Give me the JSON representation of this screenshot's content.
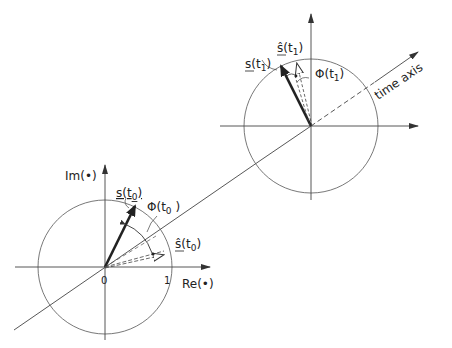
{
  "figure": {
    "type": "phasor-diagram",
    "colors": {
      "line": "#333333",
      "background": "#ffffff"
    },
    "time_axis_label": "time axis",
    "frame_t0": {
      "imag_axis_label": "Im(•)",
      "real_axis_label": "Re(•)",
      "origin_label": "0",
      "unit_label": "1",
      "phasor_label": "s(t",
      "phasor_sub": "0",
      "estimate_label": "ŝ(t",
      "estimate_sub": "0",
      "phase_label": "Φ(t",
      "phase_sub": "0"
    },
    "frame_t1": {
      "phasor_label": "s(t",
      "phasor_sub": "1",
      "estimate_label": "ŝ(t",
      "estimate_sub": "1",
      "phase_label": "Φ(t",
      "phase_sub": "1"
    }
  }
}
